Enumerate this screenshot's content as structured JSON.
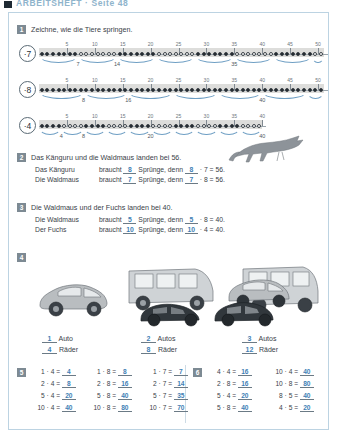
{
  "header": {
    "title": "ARBEITSHEFT · Seite 48"
  },
  "tasks": {
    "t1": {
      "number": "1",
      "title": "Zeichne, wie die Tiere springen.",
      "tick_labels": [
        "5",
        "10",
        "15",
        "20",
        "25",
        "30",
        "35",
        "40",
        "45",
        "50"
      ],
      "lines": [
        {
          "label": "·7",
          "step": 7,
          "max": 51,
          "arc_labels": [
            "7",
            "14",
            "35"
          ],
          "arc_label_positions": [
            7,
            14,
            35
          ],
          "filled_pattern": "alternate"
        },
        {
          "label": "·8",
          "step": 8,
          "max": 51,
          "arc_labels": [
            "8",
            "16",
            "40"
          ],
          "arc_label_positions": [
            8,
            16,
            40
          ],
          "filled_pattern": "all"
        },
        {
          "label": "·4",
          "step": 4,
          "max": 40,
          "arc_labels": [
            "4",
            "8",
            "20",
            "40"
          ],
          "arc_label_positions": [
            4,
            8,
            20,
            40
          ],
          "filled_pattern": "alternate"
        }
      ]
    },
    "t2": {
      "number": "2",
      "title": "Das Känguru und die Waldmaus landen bei 56.",
      "rows": [
        {
          "subject": "Das Känguru",
          "verb": "braucht",
          "a": "8",
          "mid": "Sprünge, denn",
          "b": "8",
          "op": "· 7 = 56."
        },
        {
          "subject": "Die Waldmaus",
          "verb": "braucht",
          "a": "7",
          "mid": "Sprünge, denn",
          "b": "7",
          "op": "· 8 = 56."
        }
      ]
    },
    "t3": {
      "number": "3",
      "title": "Die Waldmaus und der Fuchs landen bei 40.",
      "rows": [
        {
          "subject": "Die Waldmaus",
          "verb": "braucht",
          "a": "5",
          "mid": "Sprünge, denn",
          "b": "5",
          "op": "· 8 = 40."
        },
        {
          "subject": "Der Fuchs",
          "verb": "braucht",
          "a": "10",
          "mid": "Sprünge, denn",
          "b": "10",
          "op": "· 4 = 40."
        }
      ]
    },
    "t4": {
      "number": "4",
      "groups": [
        {
          "count": "1",
          "unit": "Auto",
          "wheels": "4",
          "wheels_unit": "Räder",
          "cars": 1
        },
        {
          "count": "2",
          "unit": "Autos",
          "wheels": "8",
          "wheels_unit": "Räder",
          "cars": 2
        },
        {
          "count": "3",
          "unit": "Autos",
          "wheels": "12",
          "wheels_unit": "Räder",
          "cars": 3
        }
      ]
    },
    "t5": {
      "number": "5",
      "columns": [
        [
          {
            "expr": "1 · 4 =",
            "ans": "4"
          },
          {
            "expr": "2 · 4 =",
            "ans": "8"
          },
          {
            "expr": "5 · 4 =",
            "ans": "20"
          },
          {
            "expr": "10 · 4 =",
            "ans": "40"
          }
        ],
        [
          {
            "expr": "1 · 8 =",
            "ans": "8"
          },
          {
            "expr": "2 · 8 =",
            "ans": "16"
          },
          {
            "expr": "5 · 8 =",
            "ans": "40"
          },
          {
            "expr": "10 · 8 =",
            "ans": "80"
          }
        ],
        [
          {
            "expr": "1 · 7 =",
            "ans": "7"
          },
          {
            "expr": "2 · 7 =",
            "ans": "14"
          },
          {
            "expr": "5 · 7 =",
            "ans": "35"
          },
          {
            "expr": "10 · 7 =",
            "ans": "70"
          }
        ]
      ]
    },
    "t6": {
      "number": "6",
      "columns": [
        [
          {
            "expr": "4 · 4 =",
            "ans": "16"
          },
          {
            "expr": "2 · 8 =",
            "ans": "16"
          },
          {
            "expr": "5 · 4 =",
            "ans": "20"
          },
          {
            "expr": "5 · 8 =",
            "ans": "40"
          }
        ],
        [
          {
            "expr": "10 · 4 =",
            "ans": "40"
          },
          {
            "expr": "10 · 8 =",
            "ans": "80"
          },
          {
            "expr": "8 · 5 =",
            "ans": "40"
          },
          {
            "expr": "4 · 5 =",
            "ans": "20"
          }
        ]
      ]
    }
  },
  "colors": {
    "answer_blue": "#3f7fb5",
    "arc_blue": "#6f9fc4",
    "frame_blue": "#bcd3e2",
    "badge_gray": "#7d8a93",
    "band_gray": "#d2d2cf"
  }
}
